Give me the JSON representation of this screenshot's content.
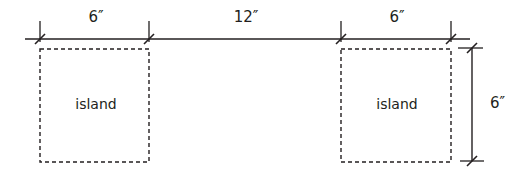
{
  "diagram": {
    "dimensions": {
      "left_island_width": "6″",
      "gap_width": "12″",
      "right_island_width": "6″",
      "island_height": "6″"
    },
    "islands": [
      {
        "label": "island"
      },
      {
        "label": "island"
      }
    ],
    "colors": {
      "line": "#231f20",
      "background": "#ffffff"
    }
  }
}
